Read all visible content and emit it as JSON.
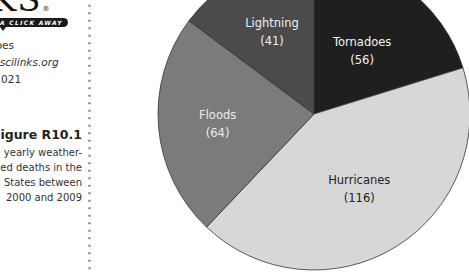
{
  "sidebar": {
    "logo_text": "NKS",
    "logo_mark": "®",
    "tagline": "A CLICK AWAY",
    "topic": "does",
    "url": "v.scilinks.org",
    "code": "1 021",
    "figure_label": "Figure R10.1",
    "caption_lines": [
      "yearly weather-",
      "ed deaths in the",
      "States between",
      "2000 and 2009"
    ]
  },
  "chart_data": {
    "type": "pie",
    "title": "",
    "start_angle_deg": 0,
    "direction": "clockwise",
    "slices": [
      {
        "label": "Tornadoes",
        "value": 56,
        "color": "#1f1f1f",
        "text_color": "#f2f2f2"
      },
      {
        "label": "Hurricanes",
        "value": 116,
        "color": "#d7d7d7",
        "text_color": "#222222"
      },
      {
        "label": "Floods",
        "value": 64,
        "color": "#7b7b7b",
        "text_color": "#ececec"
      },
      {
        "label": "Lightning",
        "value": 41,
        "color": "#4b4b4b",
        "text_color": "#efefef"
      }
    ],
    "total": 277,
    "center": [
      314,
      114
    ],
    "radius": 156,
    "stroke": "#333333"
  }
}
